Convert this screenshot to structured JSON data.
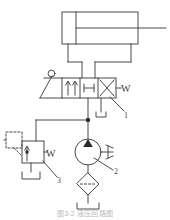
{
  "diagram": {
    "stroke_color": "#4a4a4a",
    "fill_color": "#2b2b2b",
    "background_color": "#ffffff",
    "caption": "图3-2  液压回路图",
    "components": {
      "cylinder": {
        "name": "double-acting-cylinder",
        "label": ""
      },
      "directional_valve": {
        "name": "4-3-way-directional-control-valve",
        "label": "1",
        "positions": 3,
        "left_actuator": "manual-lever",
        "right_actuator": "spring",
        "right_actuator_symbol": "W"
      },
      "pump": {
        "name": "hydraulic-pump",
        "label": "2",
        "drive": "motor"
      },
      "relief_valve": {
        "name": "pressure-relief-valve",
        "label": "3",
        "spring_symbol": "W",
        "pilot": "dashed-pilot-line"
      },
      "filter": {
        "name": "filter",
        "label": ""
      },
      "tank": {
        "name": "reservoir",
        "label": ""
      }
    },
    "labels": [
      {
        "id": "label-1",
        "text": "1"
      },
      {
        "id": "label-2",
        "text": "2"
      },
      {
        "id": "label-3",
        "text": "3"
      }
    ],
    "spring_labels": [
      {
        "id": "valve-spring-w",
        "text": "W"
      },
      {
        "id": "relief-spring-w",
        "text": "W"
      }
    ]
  }
}
